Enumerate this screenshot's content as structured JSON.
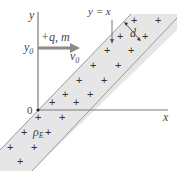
{
  "diagram": {
    "axes": {
      "x_label": "x",
      "y_label": "y",
      "origin_label": "0"
    },
    "particle": {
      "charge_label": "+q, m",
      "velocity_label": "v",
      "velocity_sub": "0",
      "y0_label": "y",
      "y0_sub": "0"
    },
    "band": {
      "line_label": "y = x",
      "width_label": "d",
      "density_label": "ρ",
      "density_sub": "E",
      "plus_symbol": "+"
    },
    "colors": {
      "band_fill": "#e6e6e6",
      "band_edge": "#9a9a9a",
      "axis": "#7a7a7a",
      "arrow": "#8a8a8a",
      "text": "#444444"
    }
  }
}
